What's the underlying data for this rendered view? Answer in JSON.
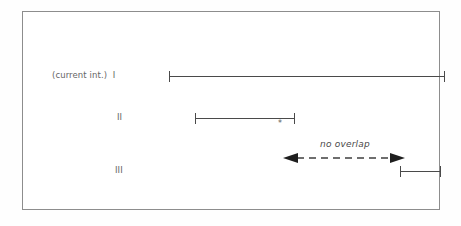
{
  "figure": {
    "background_color": "#ffffff",
    "border_color": "#8d8d8d",
    "line_color": "#4a4a4a",
    "text_color": "#5a5a5a"
  },
  "rows": [
    {
      "label": "(current int.)  I",
      "numeral": "I",
      "prefix": "(current int.)",
      "bar_start_px": 146,
      "bar_end_px": 422,
      "baseline_y_px": 64
    },
    {
      "label": "II",
      "numeral": "II",
      "prefix": "",
      "bar_start_px": 172,
      "bar_end_px": 272,
      "baseline_y_px": 106
    },
    {
      "label": "III",
      "numeral": "III",
      "prefix": "",
      "bar_start_px": 377,
      "bar_end_px": 418,
      "baseline_y_px": 159
    }
  ],
  "markers": {
    "asterisk": "*"
  },
  "annotation": {
    "text": "no overlap",
    "style": "italic",
    "arrow": {
      "type": "double-headed-dashed",
      "start_px": 261,
      "end_px": 380,
      "y_px": 146
    }
  }
}
